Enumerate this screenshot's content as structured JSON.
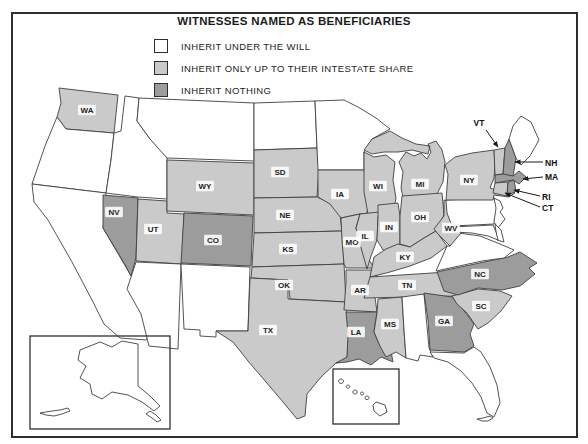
{
  "figure": {
    "title": "WITNESSES NAMED AS BENEFICIARIES",
    "legend": [
      {
        "key": "will",
        "label": "INHERIT UNDER THE WILL",
        "color": "#ffffff"
      },
      {
        "key": "intestate",
        "label": "INHERIT ONLY UP TO THEIR INTESTATE SHARE",
        "color": "#cacaca"
      },
      {
        "key": "nothing",
        "label": "INHERIT NOTHING",
        "color": "#9c9c9c"
      }
    ],
    "colors": {
      "border": "#3f3f3f",
      "label_text": "#222222",
      "label_bg": "#ffffff"
    },
    "map": {
      "states": [
        {
          "id": "WA",
          "label": "WA",
          "category": "intestate"
        },
        {
          "id": "OR",
          "label": "",
          "category": "will"
        },
        {
          "id": "CA",
          "label": "",
          "category": "will"
        },
        {
          "id": "ID",
          "label": "",
          "category": "will"
        },
        {
          "id": "MT",
          "label": "",
          "category": "will"
        },
        {
          "id": "NV",
          "label": "NV",
          "category": "nothing"
        },
        {
          "id": "UT",
          "label": "UT",
          "category": "intestate"
        },
        {
          "id": "AZ",
          "label": "",
          "category": "will"
        },
        {
          "id": "WY",
          "label": "WY",
          "category": "intestate"
        },
        {
          "id": "CO",
          "label": "CO",
          "category": "nothing"
        },
        {
          "id": "NM",
          "label": "",
          "category": "will"
        },
        {
          "id": "ND",
          "label": "",
          "category": "will"
        },
        {
          "id": "SD",
          "label": "SD",
          "category": "intestate"
        },
        {
          "id": "NE",
          "label": "NE",
          "category": "intestate"
        },
        {
          "id": "KS",
          "label": "KS",
          "category": "intestate"
        },
        {
          "id": "OK",
          "label": "OK",
          "category": "intestate"
        },
        {
          "id": "TX",
          "label": "TX",
          "category": "intestate"
        },
        {
          "id": "MN",
          "label": "",
          "category": "will"
        },
        {
          "id": "IA",
          "label": "IA",
          "category": "intestate"
        },
        {
          "id": "MO",
          "label": "MO",
          "category": "intestate"
        },
        {
          "id": "AR",
          "label": "AR",
          "category": "intestate"
        },
        {
          "id": "LA",
          "label": "LA",
          "category": "nothing"
        },
        {
          "id": "WI",
          "label": "WI",
          "category": "intestate"
        },
        {
          "id": "MI",
          "label": "MI",
          "category": "intestate"
        },
        {
          "id": "IL",
          "label": "IL",
          "category": "intestate"
        },
        {
          "id": "IN",
          "label": "IN",
          "category": "intestate"
        },
        {
          "id": "OH",
          "label": "OH",
          "category": "intestate"
        },
        {
          "id": "KY",
          "label": "KY",
          "category": "intestate"
        },
        {
          "id": "TN",
          "label": "TN",
          "category": "intestate"
        },
        {
          "id": "MS",
          "label": "MS",
          "category": "intestate"
        },
        {
          "id": "AL",
          "label": "",
          "category": "will"
        },
        {
          "id": "GA",
          "label": "GA",
          "category": "nothing"
        },
        {
          "id": "FL",
          "label": "",
          "category": "will"
        },
        {
          "id": "SC",
          "label": "SC",
          "category": "intestate"
        },
        {
          "id": "NC",
          "label": "NC",
          "category": "nothing"
        },
        {
          "id": "VA",
          "label": "",
          "category": "will"
        },
        {
          "id": "WV",
          "label": "WV",
          "category": "intestate"
        },
        {
          "id": "OH2",
          "label": "",
          "category": "will"
        },
        {
          "id": "PA",
          "label": "",
          "category": "will"
        },
        {
          "id": "NY",
          "label": "NY",
          "category": "intestate"
        },
        {
          "id": "NJ",
          "label": "",
          "category": "will"
        },
        {
          "id": "DE",
          "label": "",
          "category": "will"
        },
        {
          "id": "MD",
          "label": "",
          "category": "will"
        },
        {
          "id": "VT",
          "label": "",
          "category": "intestate"
        },
        {
          "id": "NH",
          "label": "",
          "category": "nothing"
        },
        {
          "id": "MA",
          "label": "",
          "category": "nothing"
        },
        {
          "id": "CT",
          "label": "",
          "category": "intestate"
        },
        {
          "id": "RI",
          "label": "",
          "category": "nothing"
        },
        {
          "id": "ME",
          "label": "",
          "category": "will"
        },
        {
          "id": "AK",
          "label": "",
          "category": "will"
        },
        {
          "id": "HI",
          "label": "",
          "category": "will"
        }
      ],
      "callouts": [
        {
          "id": "VT",
          "label": "VT"
        },
        {
          "id": "NH",
          "label": "NH"
        },
        {
          "id": "MA",
          "label": "MA"
        },
        {
          "id": "RI",
          "label": "RI"
        },
        {
          "id": "CT",
          "label": "CT"
        }
      ]
    }
  }
}
